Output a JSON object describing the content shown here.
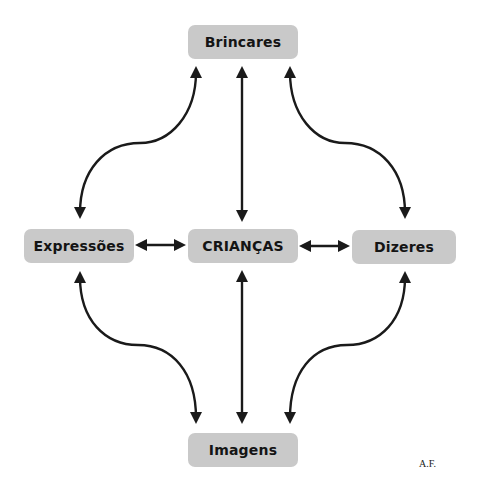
{
  "diagram": {
    "center": "CRIANÇAS",
    "nodes": {
      "brincares": "Brincares",
      "expressoes": "Expressões",
      "criancas": "CRIANÇAS",
      "dizeres": "Dizeres",
      "imagens": "Imagens"
    },
    "edges": [
      {
        "from": "Brincares",
        "to": "CRIANÇAS",
        "type": "bidirectional-straight"
      },
      {
        "from": "CRIANÇAS",
        "to": "Imagens",
        "type": "bidirectional-straight"
      },
      {
        "from": "Expressões",
        "to": "CRIANÇAS",
        "type": "bidirectional-straight"
      },
      {
        "from": "CRIANÇAS",
        "to": "Dizeres",
        "type": "bidirectional-straight"
      },
      {
        "from": "Brincares",
        "to": "Expressões",
        "type": "bidirectional-curved"
      },
      {
        "from": "Brincares",
        "to": "Dizeres",
        "type": "bidirectional-curved"
      },
      {
        "from": "Expressões",
        "to": "Imagens",
        "type": "bidirectional-curved"
      },
      {
        "from": "Dizeres",
        "to": "Imagens",
        "type": "bidirectional-curved"
      }
    ],
    "colors": {
      "node_fill": "#c9c9c9",
      "text": "#141414",
      "arrow": "#1a1a1a"
    }
  },
  "signature": "A.F."
}
